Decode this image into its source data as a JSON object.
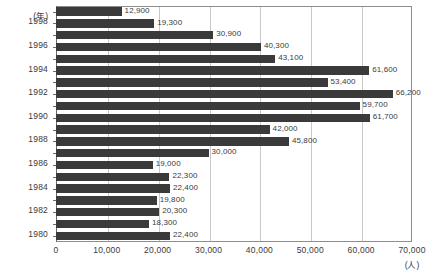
{
  "chart_data": {
    "type": "bar",
    "orientation": "horizontal",
    "title": "",
    "xlabel": "(人)",
    "ylabel": "(年)",
    "xlim": [
      0,
      70000
    ],
    "xticks": [
      0,
      10000,
      20000,
      30000,
      40000,
      50000,
      60000,
      70000
    ],
    "xtick_labels": [
      "0",
      "10,000",
      "20,000",
      "30,000",
      "40,000",
      "50,000",
      "60,000",
      "70,000"
    ],
    "grid": true,
    "grid_axis": "x",
    "legend": "none",
    "bar_color": "#3a3a3a",
    "categories": [
      "1999",
      "1998",
      "1997",
      "1996",
      "1995",
      "1994",
      "1993",
      "1992",
      "1991",
      "1990",
      "1989",
      "1988",
      "1987",
      "1986",
      "1985",
      "1984",
      "1983",
      "1982",
      "1981",
      "1980"
    ],
    "ytick_labels": [
      "1998",
      "1996",
      "1994",
      "1992",
      "1990",
      "1988",
      "1986",
      "1984",
      "1982",
      "1980"
    ],
    "values": [
      12900,
      19300,
      30900,
      40300,
      43100,
      61600,
      53400,
      66200,
      59700,
      61700,
      42000,
      45800,
      30000,
      19000,
      22300,
      22400,
      19800,
      20300,
      18300,
      22400
    ],
    "value_labels": [
      "12,900",
      "19,300",
      "30,900",
      "40,300",
      "43,100",
      "61,600",
      "53,400",
      "66,200",
      "59,700",
      "61,700",
      "42,000",
      "45,800",
      "30,000",
      "19,000",
      "22,300",
      "22,400",
      "19,800",
      "20,300",
      "18,300",
      "22,400"
    ]
  }
}
